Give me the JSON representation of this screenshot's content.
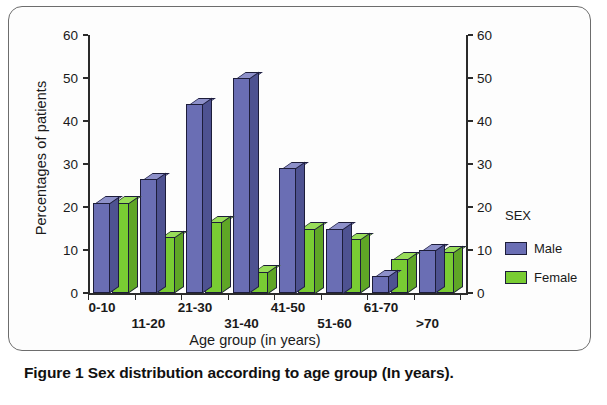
{
  "figure": {
    "caption": "Figure 1 Sex distribution according to age group (In years)."
  },
  "legend": {
    "title": "SEX",
    "entries": [
      {
        "label": "Male",
        "color": "#6a6eb4"
      },
      {
        "label": "Female",
        "color": "#79cc33"
      }
    ]
  },
  "axis": {
    "y_title": "Percentages of patients",
    "x_title": "Age group (in years)",
    "y_ticks": [
      "0",
      "10",
      "20",
      "30",
      "40",
      "50",
      "60"
    ]
  },
  "chart_data": {
    "type": "bar",
    "title": "Sex distribution according to age group (In years)",
    "xlabel": "Age group (in years)",
    "ylabel": "Percentages of patients",
    "ylim": [
      0,
      60
    ],
    "ytick_values": [
      0,
      10,
      20,
      30,
      40,
      50,
      60
    ],
    "grid": false,
    "legend_position": "right",
    "legend_title": "SEX",
    "dual_y_axis": true,
    "three_d": true,
    "categories": [
      "0-10",
      "11-20",
      "21-30",
      "31-40",
      "41-50",
      "51-60",
      "61-70",
      ">70"
    ],
    "series": [
      {
        "name": "Male",
        "color": "#6a6eb4",
        "values": [
          21,
          26.5,
          44,
          50,
          29,
          15,
          4,
          10
        ]
      },
      {
        "name": "Female",
        "color": "#79cc33",
        "values": [
          21,
          13,
          16.5,
          5,
          15,
          12.5,
          8,
          9.5
        ]
      }
    ]
  }
}
